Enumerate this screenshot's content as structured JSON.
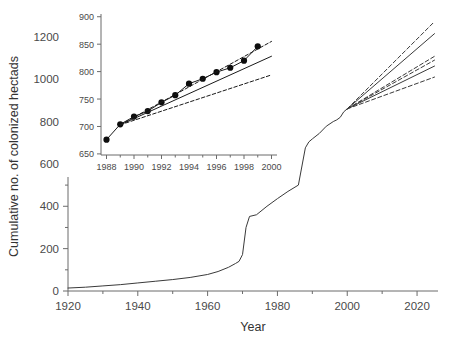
{
  "chart_data": [
    {
      "id": "main",
      "type": "line",
      "title": "",
      "xlabel": "Year",
      "ylabel": "Cumulative no. of colonized hectads",
      "xlim": [
        1920,
        2026
      ],
      "ylim": [
        0,
        1270
      ],
      "xticks": [
        1920,
        1940,
        1960,
        1980,
        2000,
        2020
      ],
      "xtick_labels": [
        "1920",
        "1940",
        "1960",
        "1980",
        "2000",
        "2020"
      ],
      "xminor_ticks": [
        1930,
        1950,
        1970,
        1990,
        2010
      ],
      "yticks": [
        0,
        200,
        400,
        600,
        800,
        1000,
        1200
      ],
      "ytick_labels": [
        "0",
        "200",
        "400",
        "600",
        "800",
        "1000",
        "1200"
      ],
      "yminor_ticks": [
        100,
        300,
        500,
        700,
        900,
        1100
      ],
      "grid": false,
      "legend": "none",
      "series": [
        {
          "name": "observed-cumulative",
          "style": "solid",
          "x": [
            1920,
            1925,
            1930,
            1935,
            1940,
            1945,
            1950,
            1955,
            1960,
            1963,
            1966,
            1968,
            1969,
            1970,
            1971,
            1972,
            1974,
            1977,
            1980,
            1983,
            1986,
            1988,
            1989,
            1990,
            1992,
            1994,
            1996,
            1997,
            1998,
            1999,
            2000
          ],
          "y": [
            14,
            18,
            24,
            30,
            38,
            46,
            54,
            64,
            78,
            92,
            112,
            130,
            140,
            172,
            300,
            352,
            360,
            400,
            436,
            470,
            500,
            676,
            704,
            718,
            744,
            778,
            800,
            808,
            820,
            846,
            860
          ]
        },
        {
          "name": "projection-high-mean",
          "style": "solid",
          "x": [
            2000,
            2025
          ],
          "y": [
            860,
            1215
          ]
        },
        {
          "name": "projection-high-upper",
          "style": "dashed",
          "x": [
            2000,
            2025
          ],
          "y": [
            860,
            1272
          ]
        },
        {
          "name": "projection-high-lower",
          "style": "dashed",
          "x": [
            2000,
            2025
          ],
          "y": [
            860,
            1108
          ]
        },
        {
          "name": "projection-low-mean",
          "style": "solid",
          "x": [
            2000,
            2025
          ],
          "y": [
            860,
            1062
          ]
        },
        {
          "name": "projection-low-upper",
          "style": "dashed",
          "x": [
            2000,
            2025
          ],
          "y": [
            860,
            1090
          ]
        },
        {
          "name": "projection-low-lower",
          "style": "dashed",
          "x": [
            2000,
            2025
          ],
          "y": [
            860,
            1010
          ]
        }
      ]
    },
    {
      "id": "inset",
      "type": "line",
      "title": "",
      "xlabel": "",
      "ylabel": "",
      "xlim": [
        1987.6,
        2000.4
      ],
      "ylim": [
        648,
        905
      ],
      "xticks": [
        1988,
        1990,
        1992,
        1994,
        1996,
        1998,
        2000
      ],
      "xtick_labels": [
        "1988",
        "1990",
        "1992",
        "1994",
        "1996",
        "1998",
        "2000"
      ],
      "xminor_ticks": [
        1989,
        1991,
        1993,
        1995,
        1997,
        1999
      ],
      "yticks": [
        650,
        700,
        750,
        800,
        850,
        900
      ],
      "ytick_labels": [
        "650",
        "700",
        "750",
        "800",
        "850",
        "900"
      ],
      "grid": false,
      "legend": "none",
      "series": [
        {
          "name": "observed-points",
          "style": "solid-markers",
          "marker": "filled-circle",
          "x": [
            1988,
            1989,
            1990,
            1991,
            1992,
            1993,
            1994,
            1995,
            1996,
            1997,
            1998,
            1999
          ],
          "y": [
            676,
            704,
            718,
            728,
            744,
            757,
            778,
            787,
            799,
            807,
            820,
            846
          ]
        },
        {
          "name": "fit-mean",
          "style": "solid",
          "x": [
            1989,
            2000
          ],
          "y": [
            703,
            828
          ]
        },
        {
          "name": "fit-upper",
          "style": "dashed",
          "x": [
            1989,
            2000
          ],
          "y": [
            703,
            855
          ]
        },
        {
          "name": "fit-lower",
          "style": "dashed",
          "x": [
            1989,
            2000
          ],
          "y": [
            703,
            794
          ]
        }
      ]
    }
  ],
  "main_axis": {
    "ylabel": "Cumulative no. of colonized hectads",
    "xlabel": "Year"
  },
  "colors": {
    "line": "#3a3a3a",
    "axis": "#6b6b6b",
    "text": "#444444",
    "background": "#ffffff"
  }
}
